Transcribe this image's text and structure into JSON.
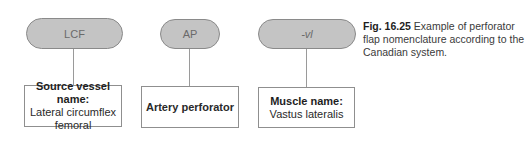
{
  "diagram": {
    "nodes": [
      {
        "abbr": "LCF",
        "italic": false,
        "box_title": "Source vessel name:",
        "box_body": [
          "Lateral circumflex",
          "femoral"
        ]
      },
      {
        "abbr": "AP",
        "italic": false,
        "box_title": "",
        "box_body": [
          "Artery perforator"
        ]
      },
      {
        "abbr": "-vl",
        "italic": true,
        "box_title": "Muscle name:",
        "box_body": [
          "Vastus lateralis"
        ]
      }
    ],
    "colors": {
      "pill_fill": "#c4c4c4",
      "pill_border": "#8a8a8a",
      "box_border": "#8f8f8f",
      "connector": "#9a9a9a"
    }
  },
  "caption": {
    "figure_label": "Fig. 16.25",
    "text": "Example of perforator flap nomenclature according to the Canadian system."
  }
}
